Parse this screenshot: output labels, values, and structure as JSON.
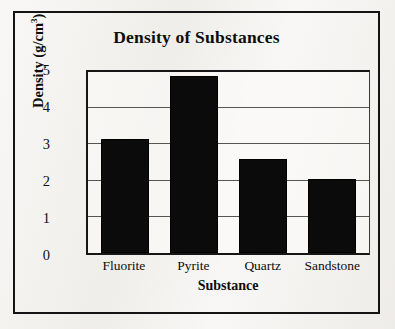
{
  "figure": {
    "background_color": "#f1efec",
    "frame_color": "#141414",
    "ink_color": "#0b0b0b"
  },
  "ghost_text": {
    "line_a": "",
    "line_b": "",
    "line_c": "",
    "line_d": ""
  },
  "chart_data": {
    "type": "bar",
    "title": "Density of Substances",
    "xlabel": "Substance",
    "ylabel": "Density (g/cm",
    "ylabel_superscript": "3",
    "ylabel_suffix": ")",
    "categories": [
      "Fluorite",
      "Pyrite",
      "Quartz",
      "Sandstone"
    ],
    "values": [
      3.15,
      4.9,
      2.6,
      2.05
    ],
    "ylim": [
      0,
      5
    ],
    "yticks": [
      0,
      1,
      2,
      3,
      4,
      5
    ],
    "ytick_labels": [
      "0",
      "1",
      "2",
      "3",
      "4",
      "5"
    ],
    "grid": true,
    "grid_axis": "y",
    "legend": false,
    "bar_color": "#0b0b0b",
    "gridline_color": "#555552",
    "axis_color": "#161616"
  }
}
